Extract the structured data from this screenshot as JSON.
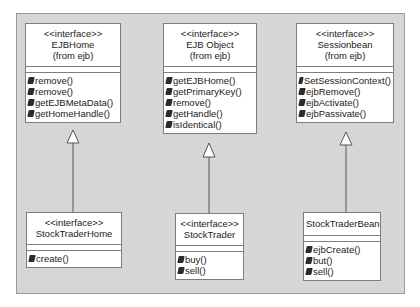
{
  "diagram": {
    "type": "UML class diagram",
    "colors": {
      "background": "#ffffff",
      "frame": "#d6d6d6",
      "box_fill": "#ffffff",
      "box_border": "#7d7d7d",
      "text": "#222222",
      "method_icon": "#2b2b2b"
    },
    "classes": [
      {
        "id": "ejbhome",
        "stereotype": "<<interface>>",
        "name": "EJBHome",
        "package": "(from ejb)",
        "operations": [
          "remove()",
          "remove()",
          "getEJBMetaData()",
          "getHomeHandle()"
        ]
      },
      {
        "id": "ejbobject",
        "stereotype": "<<interface>>",
        "name": "EJB Object",
        "package": "(from ejb)",
        "operations": [
          "getEJBHome()",
          "getPrimaryKey()",
          "remove()",
          "getHandle()",
          "isIdentical()"
        ]
      },
      {
        "id": "sessionbean",
        "stereotype": "<<interface>>",
        "name": "Sessionbean",
        "package": "(from ejb)",
        "operations": [
          "SetSessionContext()",
          "ejbRemove()",
          "ejbActivate()",
          "ejbPassivate()"
        ]
      },
      {
        "id": "stocktraderhome",
        "stereotype": "<<interface>>",
        "name": "StockTraderHome",
        "operations": [
          "create()"
        ]
      },
      {
        "id": "stocktrader",
        "stereotype": "<<interface>>",
        "name": "StockTrader",
        "operations": [
          "buy()",
          "sell()"
        ]
      },
      {
        "id": "stocktraderbean",
        "name": "StockTraderBean",
        "operations": [
          "ejbCreate()",
          "but()",
          "sell()"
        ]
      }
    ],
    "relationships": [
      {
        "type": "generalization",
        "from": "StockTraderHome",
        "to": "EJBHome"
      },
      {
        "type": "generalization",
        "from": "StockTrader",
        "to": "EJB Object"
      },
      {
        "type": "generalization",
        "from": "StockTraderBean",
        "to": "Sessionbean"
      }
    ],
    "icons": {
      "operation": "method-icon"
    }
  }
}
